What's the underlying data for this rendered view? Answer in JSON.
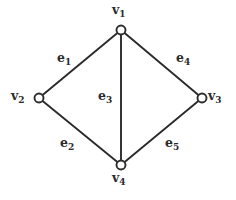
{
  "figure": {
    "type": "undirected-graph-diagram",
    "background_color": "#ffffff",
    "stroke_color": "#2b2b2b",
    "label_color": "#2b2b2b",
    "vertex_fill": "#ffffff",
    "width": 236,
    "height": 200
  },
  "vertices": [
    {
      "id": "v1",
      "base": "v",
      "sub": "1",
      "label": "v1",
      "x": 121,
      "y": 30,
      "r": 4.5,
      "label_x": 112,
      "label_y": 4
    },
    {
      "id": "v2",
      "base": "v",
      "sub": "2",
      "label": "v2",
      "x": 39,
      "y": 98,
      "r": 4.5,
      "label_x": 11,
      "label_y": 90
    },
    {
      "id": "v3",
      "base": "v",
      "sub": "3",
      "label": "v3",
      "x": 202,
      "y": 98,
      "r": 4.5,
      "label_x": 208,
      "label_y": 90
    },
    {
      "id": "v4",
      "base": "v",
      "sub": "4",
      "label": "v4",
      "x": 121,
      "y": 165,
      "r": 4.5,
      "label_x": 112,
      "label_y": 172
    }
  ],
  "edges": [
    {
      "id": "e1",
      "base": "e",
      "sub": "1",
      "label": "e1",
      "from": "v1",
      "to": "v2",
      "label_x": 57,
      "label_y": 52
    },
    {
      "id": "e2",
      "base": "e",
      "sub": "2",
      "label": "e2",
      "from": "v2",
      "to": "v4",
      "label_x": 60,
      "label_y": 137
    },
    {
      "id": "e3",
      "base": "e",
      "sub": "3",
      "label": "e3",
      "from": "v1",
      "to": "v4",
      "label_x": 98,
      "label_y": 90
    },
    {
      "id": "e4",
      "base": "e",
      "sub": "4",
      "label": "e4",
      "from": "v1",
      "to": "v3",
      "label_x": 176,
      "label_y": 52
    },
    {
      "id": "e5",
      "base": "e",
      "sub": "5",
      "label": "e5",
      "from": "v4",
      "to": "v3",
      "label_x": 165,
      "label_y": 137
    }
  ]
}
